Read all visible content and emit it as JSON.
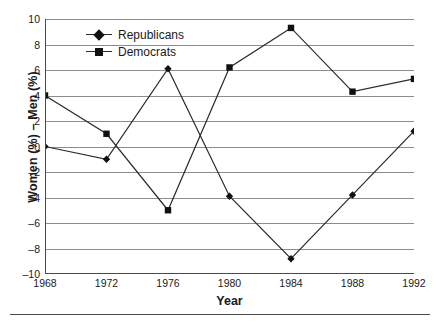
{
  "chart_data": {
    "type": "line",
    "title": "",
    "xlabel": "Year",
    "ylabel": "Women (%) – Men (%)",
    "categories": [
      "1968",
      "1972",
      "1976",
      "1980",
      "1984",
      "1988",
      "1992"
    ],
    "x": [
      1968,
      1972,
      1976,
      1980,
      1984,
      1988,
      1992
    ],
    "xlim": [
      1968,
      1992
    ],
    "ylim": [
      -10,
      10
    ],
    "yticks": [
      10,
      8,
      6,
      4,
      2,
      0,
      -2,
      -4,
      -6,
      -8,
      -10
    ],
    "ytick_labels": [
      "10",
      "8",
      "6",
      "4",
      "2",
      "0",
      "–2",
      "–4",
      "–6",
      "–8",
      "–10"
    ],
    "grid": true,
    "grid_axis": "y",
    "legend_position": "upper-left-inside",
    "series": [
      {
        "name": "Republicans",
        "marker": "diamond",
        "color": "#111111",
        "values": [
          0.0,
          -1.0,
          6.1,
          -3.9,
          -8.8,
          -3.8,
          1.2
        ]
      },
      {
        "name": "Democrats",
        "marker": "square",
        "color": "#111111",
        "values": [
          4.0,
          1.0,
          -5.0,
          6.2,
          9.3,
          4.3,
          5.3
        ]
      }
    ]
  },
  "legend": {
    "items": [
      {
        "label": "Republicans",
        "marker": "diamond"
      },
      {
        "label": "Democrats",
        "marker": "square"
      }
    ]
  },
  "colors": {
    "line": "#2b2b2b",
    "marker": "#111111",
    "grid": "#8c8c8c",
    "axis": "#4a4a4a",
    "text": "#1a1a1a",
    "background": "#ffffff"
  }
}
